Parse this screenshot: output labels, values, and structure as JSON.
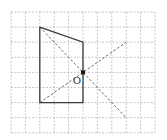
{
  "diagram": {
    "grid": {
      "origin": [
        11,
        12
      ],
      "cols": 10,
      "rows": 8,
      "cell_w": 14.4,
      "cell_h": 15.1,
      "color": "#b8b8b8"
    },
    "quadrilateral": {
      "vertices_grid": [
        [
          2,
          1
        ],
        [
          5,
          2
        ],
        [
          5,
          6
        ],
        [
          2,
          6
        ]
      ],
      "color": "#3a3a3a"
    },
    "dashed_lines": [
      {
        "from_grid": [
          2,
          1
        ],
        "to_grid": [
          8,
          7
        ]
      },
      {
        "from_grid": [
          2,
          6
        ],
        "to_grid": [
          8,
          2
        ]
      }
    ],
    "center_point": {
      "grid": [
        5,
        4
      ],
      "label": "O"
    }
  }
}
